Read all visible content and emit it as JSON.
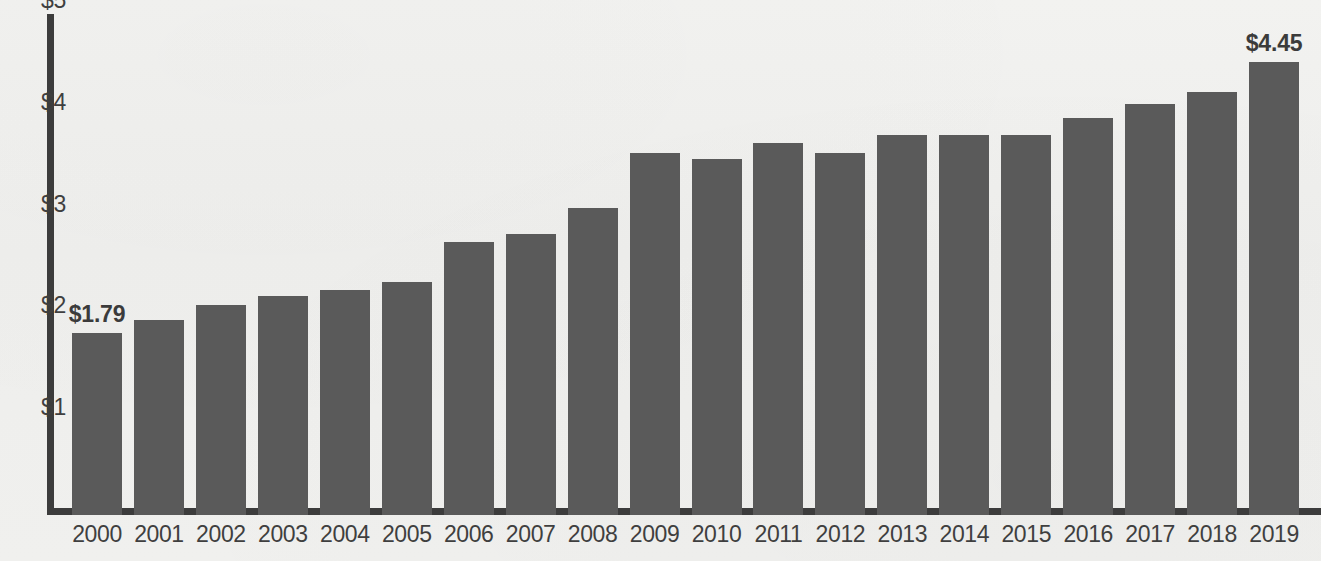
{
  "chart_data": {
    "type": "bar",
    "title": "",
    "xlabel": "",
    "ylabel": "",
    "categories": [
      "2000",
      "2001",
      "2002",
      "2003",
      "2004",
      "2005",
      "2006",
      "2007",
      "2008",
      "2009",
      "2010",
      "2011",
      "2012",
      "2013",
      "2014",
      "2015",
      "2016",
      "2017",
      "2018",
      "2019"
    ],
    "values": [
      1.79,
      1.92,
      2.06,
      2.15,
      2.21,
      2.29,
      2.68,
      2.76,
      3.02,
      3.56,
      3.5,
      3.65,
      3.56,
      3.73,
      3.73,
      3.73,
      3.9,
      4.04,
      4.16,
      4.45
    ],
    "value_labels": {
      "2000": "$1.79",
      "2019": "$4.45"
    },
    "ylim": [
      0,
      5
    ],
    "yticks": [
      1,
      2,
      3,
      4,
      5
    ],
    "ytick_labels": [
      "$1",
      "$2",
      "$3",
      "$4",
      "$5"
    ],
    "grid": false,
    "legend": null,
    "bar_color": "#5a5a5a",
    "axis_color": "#3c3c3c",
    "label_color": "#3f3f3f",
    "background_color": "#efefed"
  },
  "showthrough_text": "reverse-side print show-through"
}
